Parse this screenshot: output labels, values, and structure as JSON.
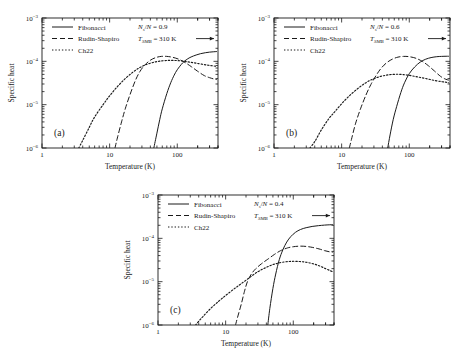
{
  "figure": {
    "background": "#ffffff",
    "foreground": "#1a1a1a",
    "panel_count": 3
  },
  "chart_data": [
    {
      "id": "panel-a",
      "type": "line",
      "panel_label": "(a)",
      "title": "",
      "xlabel": "Temperature (K)",
      "ylabel": "Specific heat",
      "xscale": "log",
      "yscale": "log",
      "xlim": [
        1,
        400
      ],
      "ylim": [
        1e-06,
        0.001
      ],
      "xticks": [
        1,
        10,
        100
      ],
      "xticklabels": [
        "1",
        "10",
        "100"
      ],
      "yticks": [
        1e-06,
        1e-05,
        0.0001,
        0.001
      ],
      "yticklabels": [
        "10-6",
        "10-5",
        "10-4",
        "10-3"
      ],
      "grid": false,
      "legend_position": "upper left",
      "annotations": [
        {
          "text": "Ns/N = 0.9",
          "base": "N",
          "sub": "s",
          "rest": "/N = 0.9"
        },
        {
          "text": "TSMB = 310 K",
          "base": "T",
          "sub": "SMB",
          "rest": " = 310 K",
          "arrow": true
        }
      ],
      "series": [
        {
          "name": "Fibonacci",
          "style": "solid",
          "x": [
            45,
            50,
            55,
            60,
            70,
            80,
            90,
            100,
            120,
            140,
            160,
            190,
            220,
            260,
            300,
            340,
            380
          ],
          "y": [
            1e-06,
            2.2e-06,
            4.5e-06,
            8e-06,
            1.8e-05,
            3.2e-05,
            4.8e-05,
            6.4e-05,
            9.2e-05,
            0.000112,
            0.000126,
            0.00014,
            0.00015,
            0.000158,
            0.000163,
            0.000166,
            0.000168
          ]
        },
        {
          "name": "Rudin-Shapiro",
          "style": "dashed",
          "x": [
            12,
            13,
            15,
            17,
            20,
            24,
            28,
            33,
            40,
            48,
            58,
            70,
            85,
            105,
            130,
            160,
            200,
            250,
            300,
            350,
            380
          ],
          "y": [
            1e-06,
            1.7e-06,
            4e-06,
            8e-06,
            1.7e-05,
            3.6e-05,
            5.8e-05,
            8.2e-05,
            0.000106,
            0.000122,
            0.00013,
            0.00013,
            0.000124,
            0.000112,
            9.4e-05,
            7.6e-05,
            5.9e-05,
            4.7e-05,
            4.2e-05,
            3.9e-05,
            3.8e-05
          ]
        },
        {
          "name": "Ch22",
          "style": "dotted",
          "x": [
            3.5,
            4,
            5,
            6,
            8,
            10,
            13,
            17,
            22,
            28,
            36,
            46,
            58,
            72,
            90,
            115,
            145,
            180,
            230,
            290,
            350,
            380
          ],
          "y": [
            1e-06,
            1.5e-06,
            3e-06,
            5.2e-06,
            1e-05,
            1.6e-05,
            2.6e-05,
            4e-05,
            5.6e-05,
            7.2e-05,
            8.6e-05,
            9.6e-05,
            0.000102,
            0.000105,
            0.000105,
            0.000102,
            9.7e-05,
            9.2e-05,
            8.6e-05,
            8.1e-05,
            7.8e-05,
            7.6e-05
          ]
        }
      ]
    },
    {
      "id": "panel-b",
      "type": "line",
      "panel_label": "(b)",
      "title": "",
      "xlabel": "Temperature (K)",
      "ylabel": "Specific heat",
      "xscale": "log",
      "yscale": "log",
      "xlim": [
        1,
        400
      ],
      "ylim": [
        1e-06,
        0.001
      ],
      "xticks": [
        1,
        10,
        100
      ],
      "xticklabels": [
        "1",
        "10",
        "100"
      ],
      "yticks": [
        1e-06,
        1e-05,
        0.0001,
        0.001
      ],
      "yticklabels": [
        "10-6",
        "10-5",
        "10-4",
        "10-3"
      ],
      "grid": false,
      "legend_position": "upper left",
      "annotations": [
        {
          "text": "Ns/N = 0.6",
          "base": "N",
          "sub": "s",
          "rest": "/N = 0.6"
        },
        {
          "text": "TSMB = 310 K",
          "base": "T",
          "sub": "SMB",
          "rest": " = 310 K",
          "arrow": true
        }
      ],
      "series": [
        {
          "name": "Fibonacci",
          "style": "solid",
          "x": [
            48,
            52,
            58,
            65,
            75,
            85,
            100,
            120,
            145,
            175,
            210,
            255,
            300,
            350,
            380
          ],
          "y": [
            1e-06,
            2e-06,
            4.6e-06,
            9e-06,
            1.9e-05,
            3.2e-05,
            5.2e-05,
            7.4e-05,
            9.6e-05,
            0.000112,
            0.000122,
            0.000128,
            0.00013,
            0.000131,
            0.000131
          ]
        },
        {
          "name": "Rudin-Shapiro",
          "style": "dashed",
          "x": [
            13,
            14,
            16,
            19,
            23,
            27,
            32,
            38,
            46,
            56,
            68,
            83,
            100,
            125,
            155,
            190,
            235,
            290,
            340,
            380
          ],
          "y": [
            1e-06,
            1.6e-06,
            3.6e-06,
            8e-06,
            1.7e-05,
            2.9e-05,
            4.6e-05,
            6.8e-05,
            9.2e-05,
            0.000112,
            0.000125,
            0.00013,
            0.000128,
            0.000118,
            0.0001,
            8e-05,
            6e-05,
            4.5e-05,
            3.9e-05,
            3.7e-05
          ]
        },
        {
          "name": "Ch22",
          "style": "dotted",
          "x": [
            3.4,
            4,
            5,
            6.5,
            8,
            10,
            13,
            17,
            22,
            28,
            36,
            46,
            58,
            74,
            95,
            120,
            150,
            190,
            240,
            300,
            350,
            380
          ],
          "y": [
            1e-06,
            1.4e-06,
            2.6e-06,
            4.8e-06,
            7e-06,
            1.05e-05,
            1.6e-05,
            2.3e-05,
            3.1e-05,
            3.8e-05,
            4.4e-05,
            4.8e-05,
            5e-05,
            5e-05,
            4.8e-05,
            4.5e-05,
            4.2e-05,
            3.9e-05,
            3.6e-05,
            3.4e-05,
            3.3e-05,
            3.2e-05
          ]
        }
      ]
    },
    {
      "id": "panel-c",
      "type": "line",
      "panel_label": "(c)",
      "title": "",
      "xlabel": "Temperature (K)",
      "ylabel": "Specific heat",
      "xscale": "log",
      "yscale": "log",
      "xlim": [
        1,
        400
      ],
      "ylim": [
        1e-06,
        0.001
      ],
      "xticks": [
        1,
        10,
        100
      ],
      "xticklabels": [
        "1",
        "10",
        "100"
      ],
      "yticks": [
        1e-06,
        1e-05,
        0.0001,
        0.001
      ],
      "yticklabels": [
        "10-6",
        "10-5",
        "10-4",
        "10-3"
      ],
      "grid": false,
      "legend_position": "upper left",
      "annotations": [
        {
          "text": "Ns/N = 0.4",
          "base": "N",
          "sub": "s",
          "rest": "/N = 0.4"
        },
        {
          "text": "TSMB = 310 K",
          "base": "T",
          "sub": "SMB",
          "rest": " = 310 K",
          "arrow": true
        }
      ],
      "series": [
        {
          "name": "Fibonacci",
          "style": "solid",
          "x": [
            42,
            45,
            50,
            55,
            62,
            70,
            80,
            92,
            108,
            128,
            155,
            190,
            235,
            290,
            340,
            380
          ],
          "y": [
            1e-06,
            2.4e-06,
            7e-06,
            1.5e-05,
            3.2e-05,
            5.4e-05,
            8.2e-05,
            0.00011,
            0.000138,
            0.00016,
            0.000176,
            0.000188,
            0.000196,
            0.000202,
            0.000205,
            0.000206
          ]
        },
        {
          "name": "Rudin-Shapiro",
          "style": "dashed",
          "x": [
            14,
            15,
            17,
            19,
            21,
            24,
            28,
            34,
            42,
            52,
            65,
            82,
            100,
            125,
            155,
            190,
            240,
            290,
            340,
            380
          ],
          "y": [
            1e-06,
            1.5e-06,
            3e-06,
            6e-06,
            1e-05,
            1.5e-05,
            2e-05,
            2.6e-05,
            3.3e-05,
            4.2e-05,
            5.2e-05,
            6e-05,
            6.4e-05,
            6.6e-05,
            6.5e-05,
            6.2e-05,
            5.7e-05,
            5.2e-05,
            4.9e-05,
            4.8e-05
          ]
        },
        {
          "name": "Ch22",
          "style": "dotted",
          "x": [
            3.6,
            4.5,
            6,
            8,
            10,
            13,
            16,
            20,
            25,
            31,
            39,
            49,
            62,
            78,
            98,
            125,
            155,
            195,
            245,
            300,
            350,
            380
          ],
          "y": [
            1e-06,
            1.5e-06,
            2.4e-06,
            3.6e-06,
            4.8e-06,
            6.6e-06,
            8.4e-06,
            1.08e-05,
            1.4e-05,
            1.75e-05,
            2.1e-05,
            2.45e-05,
            2.72e-05,
            2.88e-05,
            2.95e-05,
            2.92e-05,
            2.8e-05,
            2.6e-05,
            2.3e-05,
            2e-05,
            1.8e-05,
            1.7e-05
          ]
        }
      ]
    }
  ]
}
